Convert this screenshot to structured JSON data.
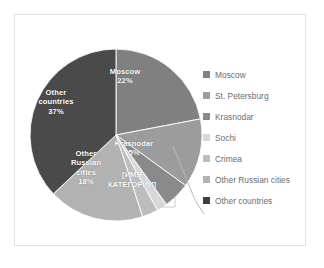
{
  "chart_data": {
    "type": "pie",
    "title": "",
    "subtitle": "",
    "xlabel": "",
    "ylabel": "",
    "grid": false,
    "legend_position": "right",
    "categories": [
      "Moscow",
      "St. Petersburg",
      "Krasnodar",
      "Sochi",
      "Crimea",
      "Other Russian cities",
      "Other countries"
    ],
    "values": [
      22,
      13,
      5,
      2,
      3,
      18,
      37
    ],
    "unit": "%",
    "colors": [
      "#808080",
      "#9c9c9c",
      "#8a8a8a",
      "#d8d8d8",
      "#bdbdbd",
      "#b2b2b2",
      "#4a4a4a"
    ],
    "slice_labels": [
      {
        "name": "Moscow",
        "value": "22%",
        "shown": true,
        "placement": "inside"
      },
      {
        "name": "St. Petersburg",
        "value": "",
        "shown": true,
        "placement": "callout",
        "raw_text": "[ИМЯ КАТЕГОРИИ]"
      },
      {
        "name": "Krasnodar",
        "value": "5%",
        "shown": true,
        "placement": "inside"
      },
      {
        "name": "Sochi",
        "value": "",
        "shown": false,
        "placement": "none"
      },
      {
        "name": "Crimea",
        "value": "",
        "shown": false,
        "placement": "none"
      },
      {
        "name": "Other Russian cities",
        "value": "18%",
        "shown": true,
        "placement": "inside"
      },
      {
        "name": "Other countries",
        "value": "37%",
        "shown": true,
        "placement": "inside"
      }
    ]
  },
  "labels": {
    "moscow": {
      "name": "Moscow",
      "pct": "22%"
    },
    "other_countries": {
      "name_line1": "Other",
      "name_line2": "countries",
      "pct": "37%"
    },
    "other_russian_cities": {
      "name_line1": "Other",
      "name_line2": "Russian",
      "name_line3": "cities",
      "pct": "18%"
    },
    "krasnodar": {
      "name": "Krasnodar",
      "pct": "5%"
    },
    "placeholder": {
      "line1": "[ИМЯ",
      "line2": "КАТЕГОРИИ]"
    }
  },
  "legend": {
    "items": [
      {
        "label": "Moscow",
        "color": "#808080"
      },
      {
        "label": "St. Petersburg",
        "color": "#9c9c9c"
      },
      {
        "label": "Krasnodar",
        "color": "#8a8a8a"
      },
      {
        "label": "Sochi",
        "color": "#d8d8d8"
      },
      {
        "label": "Crimea",
        "color": "#bdbdbd"
      },
      {
        "label": "Other Russian cities",
        "color": "#b2b2b2"
      },
      {
        "label": "Other countries",
        "color": "#3f3f3f"
      }
    ]
  }
}
